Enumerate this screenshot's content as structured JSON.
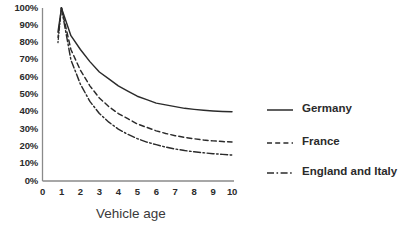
{
  "chart_data": {
    "type": "line",
    "title": "",
    "xlabel": "Vehicle age",
    "ylabel": "",
    "xlim": [
      0,
      10
    ],
    "ylim": [
      0,
      100
    ],
    "grid": false,
    "legend_position": "right",
    "x_ticks": [
      "0",
      "1",
      "2",
      "3",
      "4",
      "5",
      "6",
      "7",
      "8",
      "9",
      "10"
    ],
    "y_ticks": [
      "100%",
      "90%",
      "80%",
      "70%",
      "60%",
      "50%",
      "40%",
      "30%",
      "20%",
      "10%",
      "0%"
    ],
    "x": [
      1,
      1.5,
      2,
      2.5,
      3,
      3.5,
      4,
      4.5,
      5,
      5.5,
      6,
      6.5,
      7,
      7.5,
      8,
      8.5,
      9,
      9.5,
      10
    ],
    "series": [
      {
        "name": "Germany",
        "line_style": "solid",
        "color": "#2b2b2b",
        "values": [
          100,
          84,
          76,
          69,
          63,
          59,
          55,
          52,
          49,
          47,
          45,
          44,
          43,
          42,
          41.4,
          40.9,
          40.5,
          40.2,
          40
        ]
      },
      {
        "name": "France",
        "line_style": "dashed",
        "color": "#2b2b2b",
        "values": [
          100,
          76,
          64,
          55,
          48,
          43,
          39,
          36,
          33,
          31,
          29,
          27.5,
          26.2,
          25.2,
          24.4,
          23.7,
          23.2,
          22.8,
          22.5
        ]
      },
      {
        "name": "England and Italy",
        "line_style": "dashdot",
        "color": "#2b2b2b",
        "values": [
          100,
          70,
          56,
          46,
          39,
          34,
          30,
          27,
          24.5,
          22.5,
          21,
          19.6,
          18.5,
          17.6,
          16.9,
          16.3,
          15.8,
          15.4,
          15
        ]
      }
    ]
  },
  "legend": {
    "entries": [
      {
        "label": "Germany",
        "style": "solid"
      },
      {
        "label": "France",
        "style": "dashed"
      },
      {
        "label": "England and Italy",
        "style": "dashdot"
      }
    ]
  },
  "axes": {
    "x_title": "Vehicle age",
    "axis_color": "#8a8a8a"
  }
}
